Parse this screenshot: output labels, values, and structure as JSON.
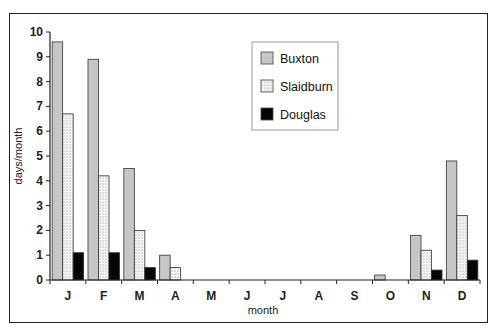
{
  "chart_data": {
    "type": "bar",
    "title": "",
    "xlabel": "month",
    "ylabel": "days/month",
    "ylim": [
      0,
      10
    ],
    "yticks": [
      0,
      1,
      2,
      3,
      4,
      5,
      6,
      7,
      8,
      9,
      10
    ],
    "grid": false,
    "legend_position": "upper center",
    "categories": [
      "J",
      "F",
      "M",
      "A",
      "M",
      "J",
      "J",
      "A",
      "S",
      "O",
      "N",
      "D"
    ],
    "series": [
      {
        "name": "Buxton",
        "color": "#c8c8c8",
        "pattern": "solid-grey",
        "values": [
          9.6,
          8.9,
          4.5,
          1.0,
          0,
          0,
          0,
          0,
          0,
          0.2,
          1.8,
          4.8
        ]
      },
      {
        "name": "Slaidburn",
        "color": "#eeeeee",
        "pattern": "dotted",
        "values": [
          6.7,
          4.2,
          2.0,
          0.5,
          0,
          0,
          0,
          0,
          0,
          0,
          1.2,
          2.6
        ]
      },
      {
        "name": "Douglas",
        "color": "#000000",
        "pattern": "solid-black",
        "values": [
          1.1,
          1.1,
          0.5,
          0,
          0,
          0,
          0,
          0,
          0,
          0,
          0.4,
          0.8
        ]
      }
    ]
  }
}
